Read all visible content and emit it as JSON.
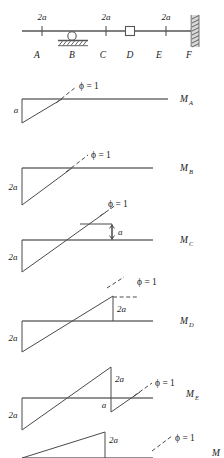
{
  "figure": {
    "title_present": false,
    "beam": {
      "name": "continuous-beam-with-hinge",
      "spans": [
        {
          "label": "2a",
          "from": "A",
          "to": "C"
        },
        {
          "label": "2a",
          "from": "C",
          "to": "E"
        },
        {
          "label": "2a",
          "from": "E",
          "to": "F"
        }
      ],
      "dimension_labels": [
        "2a",
        "2a",
        "2a"
      ],
      "nodes": [
        {
          "label": "A",
          "type": "free-end"
        },
        {
          "label": "B",
          "type": "roller-support"
        },
        {
          "label": "C",
          "type": "point"
        },
        {
          "label": "D",
          "type": "internal-hinge"
        },
        {
          "label": "E",
          "type": "point"
        },
        {
          "label": "F",
          "type": "fixed-support"
        }
      ]
    },
    "diagrams": [
      {
        "id": "M_A",
        "label": "M",
        "subscript": "A",
        "unit_rotation": "ϕ = 1",
        "ordinates": [
          {
            "text": "a",
            "position": "left",
            "side": "below"
          }
        ]
      },
      {
        "id": "M_B",
        "label": "M",
        "subscript": "B",
        "unit_rotation": "ϕ = 1",
        "ordinates": [
          {
            "text": "2a",
            "position": "left",
            "side": "below"
          }
        ]
      },
      {
        "id": "M_C",
        "label": "M",
        "subscript": "C",
        "unit_rotation": "ϕ = 1",
        "ordinates": [
          {
            "text": "2a",
            "position": "left",
            "side": "below"
          },
          {
            "text": "a",
            "position": "mid",
            "side": "above"
          }
        ]
      },
      {
        "id": "M_D",
        "label": "M",
        "subscript": "D",
        "unit_rotation": "ϕ = 1",
        "ordinates": [
          {
            "text": "2a",
            "position": "left",
            "side": "below"
          },
          {
            "text": "2a",
            "position": "mid",
            "side": "above"
          }
        ]
      },
      {
        "id": "M_E",
        "label": "M",
        "subscript": "E",
        "unit_rotation": "ϕ = 1",
        "ordinates": [
          {
            "text": "2a",
            "position": "left",
            "side": "below"
          },
          {
            "text": "2a",
            "position": "mid",
            "side": "above"
          },
          {
            "text": "a",
            "position": "mid",
            "side": "below"
          }
        ]
      },
      {
        "id": "M_F",
        "label": "M",
        "subscript": "F",
        "unit_rotation": "ϕ = 1",
        "ordinates": [
          {
            "text": "2a",
            "position": "left",
            "side": "below"
          },
          {
            "text": "2a",
            "position": "mid",
            "side": "above"
          }
        ],
        "clipped": true
      }
    ],
    "colors": {
      "line": "#555555",
      "axis": "#6e6e6e",
      "text": "#1a1a1a",
      "background": "#ffffff"
    }
  }
}
